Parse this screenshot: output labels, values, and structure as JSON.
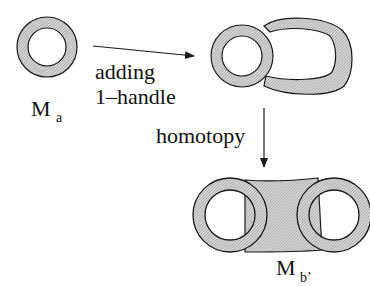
{
  "colors": {
    "fill": "#c9c9c9",
    "stroke": "#1a1a1a",
    "background": "#ffffff"
  },
  "labels": {
    "ma_main": "M",
    "ma_sub": "a",
    "mb_main": "M",
    "mb_sub": "b’",
    "step1_line1": "adding",
    "step1_line2": "1–handle",
    "step2": "homotopy"
  },
  "figures": [
    {
      "name": "annulus-Ma",
      "description": "single annulus"
    },
    {
      "name": "annulus-with-handle",
      "description": "annulus with attached 1-handle"
    },
    {
      "name": "double-annulus-Mb",
      "description": "two annuli joined by band"
    }
  ],
  "arrows": [
    {
      "name": "arrow-adding-handle",
      "from": "annulus-Ma",
      "to": "annulus-with-handle"
    },
    {
      "name": "arrow-homotopy",
      "from": "annulus-with-handle",
      "to": "double-annulus-Mb"
    }
  ]
}
